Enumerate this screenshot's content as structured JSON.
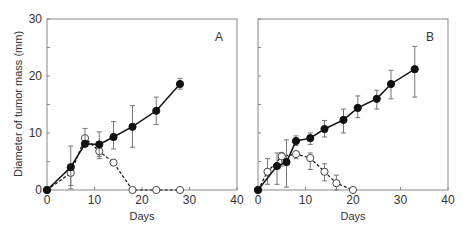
{
  "chart_data": [
    {
      "type": "line",
      "panel_label": "A",
      "xlabel": "Days",
      "ylabel": "Diameter of tumor mass (mm)",
      "xlim": [
        0,
        40
      ],
      "ylim": [
        0,
        30
      ],
      "x_ticks": [
        "0",
        "10",
        "20",
        "30",
        "40"
      ],
      "y_ticks": [
        "0",
        "10",
        "20",
        "30"
      ],
      "grid": false,
      "series": [
        {
          "name": "filled circles (solid line)",
          "marker": "filled-circle",
          "x": [
            0,
            5,
            8,
            11,
            14,
            18,
            23,
            28
          ],
          "y": [
            0,
            4.0,
            8.1,
            8.0,
            9.3,
            11.1,
            13.9,
            18.6
          ],
          "err_low": [
            0,
            0.8,
            7.8,
            5.9,
            7.2,
            7.5,
            11.5,
            17.7
          ],
          "err_high": [
            0,
            7.7,
            10.8,
            10.2,
            12.0,
            14.8,
            16.3,
            19.6
          ]
        },
        {
          "name": "open circles (dashed line)",
          "marker": "open-circle",
          "x": [
            0,
            5,
            8,
            11,
            14,
            18,
            23,
            28
          ],
          "y": [
            0,
            3.0,
            9.1,
            6.8,
            4.8,
            0,
            0,
            0
          ],
          "err_low": [
            0,
            0.2,
            9.1,
            5.5,
            4.8,
            0,
            0,
            0
          ],
          "err_high": [
            0,
            3.0,
            9.1,
            6.8,
            4.8,
            0,
            0,
            0
          ]
        }
      ]
    },
    {
      "type": "line",
      "panel_label": "B",
      "xlabel": "Days",
      "ylabel": "",
      "xlim": [
        0,
        40
      ],
      "ylim": [
        0,
        30
      ],
      "x_ticks": [
        "0",
        "10",
        "20",
        "30",
        "40"
      ],
      "y_ticks": [],
      "grid": false,
      "series": [
        {
          "name": "filled circles (solid line)",
          "marker": "filled-circle",
          "x": [
            0,
            4,
            6,
            8,
            11,
            14,
            18,
            21,
            25,
            28,
            33
          ],
          "y": [
            0,
            4.2,
            4.9,
            8.6,
            9.1,
            10.7,
            12.3,
            14.4,
            16.0,
            18.6,
            21.2
          ],
          "err_low": [
            0,
            1.0,
            0.5,
            7.8,
            8.0,
            9.3,
            10.0,
            12.7,
            14.2,
            16.0,
            16.3
          ],
          "err_high": [
            0,
            6.5,
            8.8,
            9.5,
            10.0,
            12.2,
            14.2,
            16.5,
            17.5,
            21.0,
            25.2
          ]
        },
        {
          "name": "open circles (dashed line)",
          "marker": "open-circle",
          "x": [
            0,
            2,
            5,
            8,
            11,
            14,
            16.5,
            20
          ],
          "y": [
            0,
            3.2,
            5.9,
            6.3,
            5.6,
            3.2,
            1.2,
            0
          ],
          "err_low": [
            0,
            1.0,
            4.2,
            5.5,
            3.6,
            1.6,
            0,
            0
          ],
          "err_high": [
            0,
            5.5,
            6.6,
            6.3,
            6.5,
            4.6,
            2.6,
            0
          ]
        }
      ]
    }
  ]
}
